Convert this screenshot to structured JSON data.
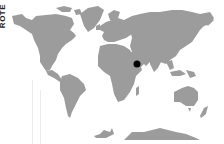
{
  "side_label": "ROTE",
  "map": {
    "type": "world-map",
    "land_color": "#9c9c9c",
    "background": "#ffffff",
    "marker": {
      "label": "location-marker",
      "region": "Arabian Peninsula",
      "color": "#000000",
      "x": 137,
      "y": 64
    }
  }
}
